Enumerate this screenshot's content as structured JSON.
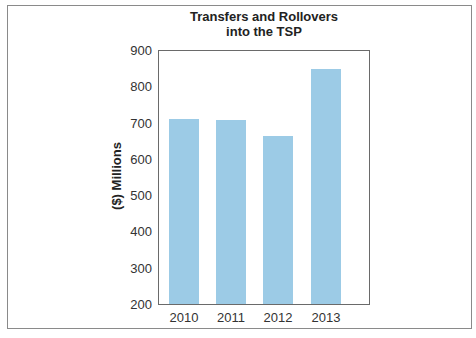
{
  "chart_data": {
    "type": "bar",
    "title": "Transfers and Rollovers into the TSP",
    "title_lines": [
      "Transfers and Rollovers",
      "into the TSP"
    ],
    "xlabel": "",
    "ylabel": "($) Millions",
    "categories": [
      "2010",
      "2011",
      "2012",
      "2013"
    ],
    "values": [
      712,
      708,
      664,
      850
    ],
    "ylim": [
      200,
      900
    ],
    "yticks": [
      900,
      800,
      700,
      600,
      500,
      400,
      300,
      200
    ],
    "grid": false,
    "legend": null,
    "bar_color": "#9ccbe6"
  }
}
